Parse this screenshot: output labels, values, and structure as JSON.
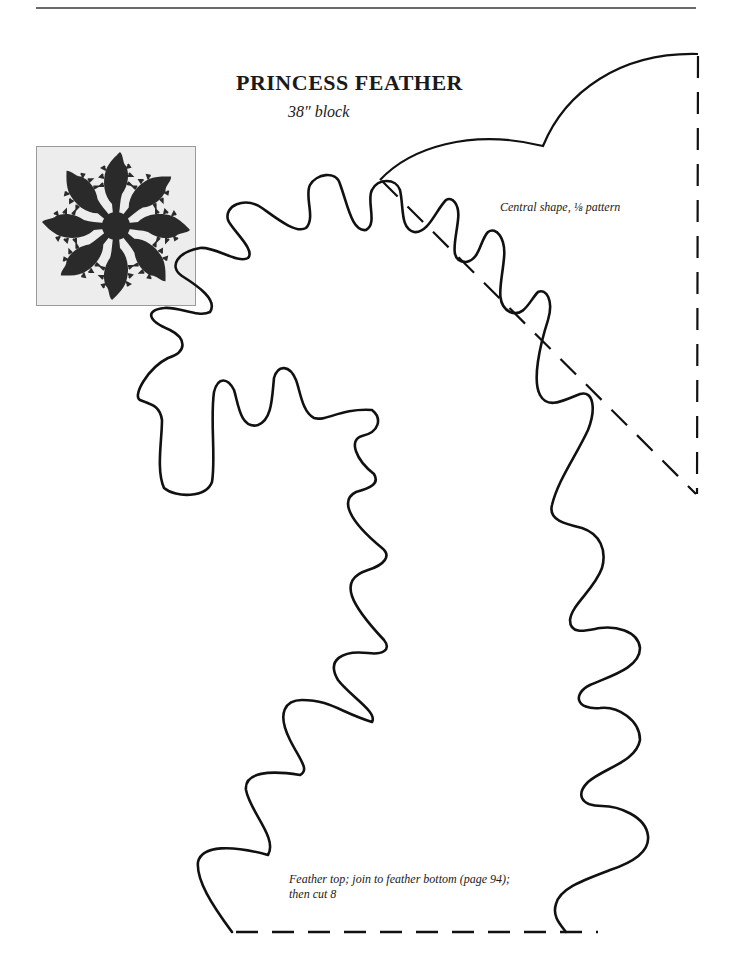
{
  "page": {
    "title": "PRINCESS FEATHER",
    "subtitle": "38″ block"
  },
  "photo": {
    "description": "Photo of Princess Feather quilt block: eight dark feathers radiating from a central star",
    "feather_count": 8,
    "fabric_color": "#2a2a2a",
    "background_color": "#ededed"
  },
  "patterns": {
    "central_shape": {
      "label": "Central shape, ⅛ pattern",
      "fold_line_style": "dashed"
    },
    "feather_top": {
      "label_line1": "Feather top; join to feather bottom (page 94);",
      "label_line2": "then cut 8",
      "join_line_style": "dashed"
    }
  },
  "colors": {
    "ink": "#111111",
    "paper": "#ffffff"
  }
}
